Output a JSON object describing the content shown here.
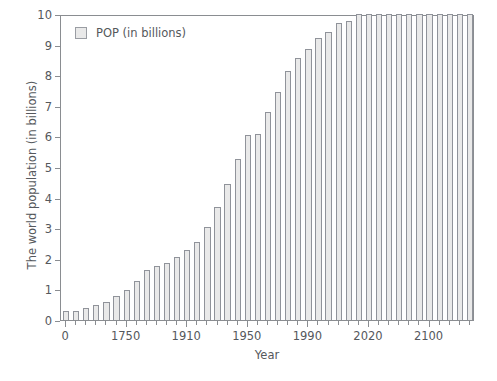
{
  "chart_data": {
    "type": "bar",
    "title": "",
    "xlabel": "Year",
    "ylabel": "The world population (in billions)",
    "ylim": [
      0,
      10
    ],
    "ytick_step": 1,
    "ytick_labels": [
      "0",
      "1",
      "2",
      "3",
      "4",
      "5",
      "6",
      "7",
      "8",
      "9",
      "10"
    ],
    "grid": false,
    "legend": {
      "position": "top-left-inside",
      "entries": [
        {
          "label": "POP (in billions)",
          "color": "#e9e9e9",
          "edge_color": "#90939a"
        }
      ]
    },
    "series_name": "POP (in billions)",
    "xtick_labels": [
      "0",
      "1750",
      "1910",
      "1950",
      "1990",
      "2020",
      "2100"
    ],
    "xtick_label_indices": [
      0,
      6,
      12,
      18,
      24,
      30,
      36
    ],
    "categories": [
      "0",
      "1000",
      "1500",
      "1650",
      "1700",
      "1750",
      "1800",
      "1850",
      "1900",
      "1910",
      "1920",
      "1930",
      "1940",
      "1950",
      "1960",
      "1970",
      "1980",
      "1990",
      "1999",
      "2000",
      "2010",
      "2020",
      "2030",
      "2040",
      "2050",
      "2060",
      "2070",
      "2080",
      "2090",
      "2100",
      "2110",
      "2120",
      "2130",
      "2140",
      "2150",
      "2160",
      "2170",
      "2180",
      "2190",
      "2200",
      "2210"
    ],
    "values": [
      0.3,
      0.31,
      0.4,
      0.5,
      0.6,
      0.79,
      0.98,
      1.26,
      1.65,
      1.75,
      1.86,
      2.07,
      2.3,
      2.56,
      3.03,
      3.7,
      4.44,
      5.27,
      6.06,
      6.07,
      6.79,
      7.45,
      8.15,
      8.55,
      8.87,
      9.2,
      9.4,
      9.7,
      9.77,
      10.0,
      10.0,
      10.0,
      10.0,
      10.0,
      10.0,
      10.0,
      10.0,
      10.0,
      10.0,
      10.0,
      10.0
    ],
    "bar_color": "#e9e9e9",
    "bar_edge_color": "#90939a",
    "axis_color": "#8a8d91",
    "text_color": "#55585c"
  }
}
